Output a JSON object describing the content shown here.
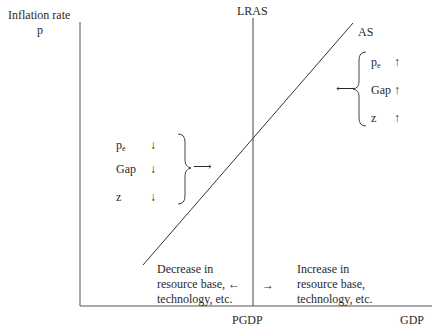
{
  "axes": {
    "y_label_line1": "Inflation rate",
    "y_label_line2": "p",
    "x_label": "GDP",
    "x_tick_label": "PGDP"
  },
  "curves": {
    "lras_label": "LRAS",
    "as_label": "AS"
  },
  "right_group": {
    "rows": [
      {
        "label": "p",
        "sub": "e",
        "arrow": "↑"
      },
      {
        "label": "Gap",
        "sub": "",
        "arrow": "↑"
      },
      {
        "label": "z",
        "sub": "",
        "arrow": "↑"
      }
    ],
    "pointer_arrow": "⟵"
  },
  "left_group": {
    "rows": [
      {
        "label": "p",
        "sub": "e",
        "arrow": "↓"
      },
      {
        "label": "Gap",
        "sub": "",
        "arrow": "↓"
      },
      {
        "label": "z",
        "sub": "",
        "arrow": "↓"
      }
    ],
    "pointer_arrow": "⟶"
  },
  "bottom_left_note": {
    "line1": "Decrease in",
    "line2": "resource base,",
    "line3": "technology, etc.",
    "arrow": "←"
  },
  "bottom_right_note": {
    "line1": "Increase in",
    "line2": "resource base,",
    "line3": "technology, etc.",
    "arrow": "→"
  },
  "colors": {
    "line": "#3a3a3a",
    "text": "#2a2a2a",
    "background": "#ffffff"
  }
}
